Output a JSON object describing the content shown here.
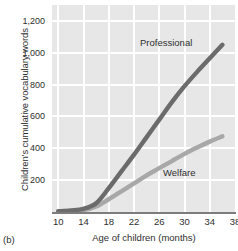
{
  "caption": "(b)",
  "chart_data": {
    "type": "line",
    "title": "",
    "xlabel": "Age of children (months)",
    "ylabel": "Children's cumulative vocabulary words",
    "xlim": [
      9,
      38
    ],
    "ylim": [
      0,
      1300
    ],
    "xticks": [
      10,
      14,
      18,
      22,
      26,
      30,
      34,
      38
    ],
    "xtick_labels": [
      "10",
      "14",
      "18",
      "22",
      "26",
      "30",
      "34",
      "38"
    ],
    "yticks": [
      200,
      400,
      600,
      800,
      1000,
      1200
    ],
    "ytick_labels": [
      "200",
      "400",
      "600",
      "800",
      "1,000",
      "1,200"
    ],
    "grid": true,
    "legend_position": "inline-annotation",
    "panel_color": "#e7e7e7",
    "grid_color": "#ffffff",
    "axis_color": "#7d7d7d",
    "series": [
      {
        "name": "Professional",
        "color": "#6b6b6b",
        "label_text": "Professional",
        "x": [
          10,
          12,
          14,
          16,
          18,
          20,
          22,
          24,
          26,
          28,
          30,
          32,
          34,
          36
        ],
        "values": [
          5,
          10,
          20,
          55,
          150,
          255,
          360,
          470,
          580,
          690,
          790,
          880,
          965,
          1050
        ]
      },
      {
        "name": "Welfare",
        "color": "#a8a8a8",
        "label_text": "Welfare",
        "x": [
          10,
          12,
          14,
          16,
          18,
          20,
          22,
          24,
          26,
          28,
          30,
          32,
          34,
          36
        ],
        "values": [
          3,
          6,
          12,
          35,
          80,
          130,
          180,
          230,
          275,
          320,
          365,
          405,
          442,
          475
        ]
      }
    ]
  }
}
